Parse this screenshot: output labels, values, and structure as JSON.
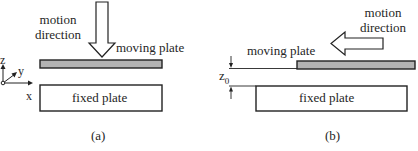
{
  "panel_a": {
    "caption": "(a)",
    "motion_label_line1": "motion",
    "motion_label_line2": "direction",
    "moving_plate_label": "moving plate",
    "fixed_plate_label": "fixed plate",
    "axes": {
      "z": "z",
      "y": "y",
      "x": "x"
    },
    "motion_direction": "down"
  },
  "panel_b": {
    "caption": "(b)",
    "motion_label_line1": "motion",
    "motion_label_line2": "direction",
    "moving_plate_label": "moving plate",
    "fixed_plate_label": "fixed plate",
    "gap_label": "z",
    "gap_subscript": "0",
    "motion_direction": "left"
  },
  "colors": {
    "stroke": "#222222",
    "moving_plate_fill": "#b3b3b3",
    "fixed_plate_fill": "#ffffff"
  }
}
